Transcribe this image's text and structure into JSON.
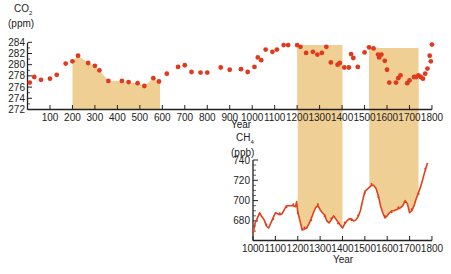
{
  "chart_data": [
    {
      "type": "scatter",
      "title": "",
      "ylabel": "CO2 (ppm)",
      "ylabel_line1": "CO",
      "ylabel_sub": "2",
      "ylabel_line2": "(ppm)",
      "xlabel": "Year",
      "xlim": [
        0,
        1800
      ],
      "ylim": [
        272,
        284
      ],
      "xticks": [
        100,
        200,
        300,
        400,
        500,
        600,
        700,
        800,
        900,
        1000,
        1100,
        1200,
        1300,
        1400,
        1500,
        1600,
        1700,
        1800
      ],
      "yticks": [
        272,
        274,
        276,
        278,
        280,
        282,
        284
      ],
      "shaded_intervals": [
        [
          200,
          590
        ],
        [
          1200,
          1400
        ],
        [
          1520,
          1740
        ]
      ],
      "points": [
        [
          10,
          276.8
        ],
        [
          30,
          277.8
        ],
        [
          60,
          277.3
        ],
        [
          100,
          277.5
        ],
        [
          130,
          278.2
        ],
        [
          170,
          280.2
        ],
        [
          200,
          280.6
        ],
        [
          225,
          281.6
        ],
        [
          270,
          280.3
        ],
        [
          300,
          279.8
        ],
        [
          320,
          279
        ],
        [
          360,
          277.1
        ],
        [
          420,
          277.1
        ],
        [
          450,
          276.9
        ],
        [
          490,
          276.7
        ],
        [
          520,
          276.2
        ],
        [
          560,
          277.6
        ],
        [
          585,
          277
        ],
        [
          620,
          278.4
        ],
        [
          670,
          279.6
        ],
        [
          700,
          279.9
        ],
        [
          730,
          278.7
        ],
        [
          770,
          278.6
        ],
        [
          800,
          278.6
        ],
        [
          860,
          279.5
        ],
        [
          900,
          279.1
        ],
        [
          950,
          279.2
        ],
        [
          980,
          278.7
        ],
        [
          1010,
          279.6
        ],
        [
          1025,
          281.3
        ],
        [
          1040,
          280.8
        ],
        [
          1060,
          282.7
        ],
        [
          1090,
          282.3
        ],
        [
          1110,
          282.7
        ],
        [
          1140,
          283.5
        ],
        [
          1160,
          283.5
        ],
        [
          1200,
          283.5
        ],
        [
          1215,
          283.2
        ],
        [
          1240,
          282.1
        ],
        [
          1270,
          282.3
        ],
        [
          1290,
          281.8
        ],
        [
          1310,
          282.1
        ],
        [
          1330,
          283.2
        ],
        [
          1350,
          280.4
        ],
        [
          1380,
          280
        ],
        [
          1390,
          280.3
        ],
        [
          1410,
          279.5
        ],
        [
          1430,
          279.5
        ],
        [
          1440,
          281.9
        ],
        [
          1450,
          281.2
        ],
        [
          1470,
          279.6
        ],
        [
          1500,
          282.2
        ],
        [
          1520,
          283.1
        ],
        [
          1540,
          282.9
        ],
        [
          1560,
          281.8
        ],
        [
          1565,
          281.3
        ],
        [
          1575,
          281.8
        ],
        [
          1590,
          280.7
        ],
        [
          1600,
          279.1
        ],
        [
          1610,
          276.8
        ],
        [
          1640,
          276.8
        ],
        [
          1650,
          277.6
        ],
        [
          1660,
          278.1
        ],
        [
          1690,
          276.7
        ],
        [
          1700,
          277.2
        ],
        [
          1720,
          277.8
        ],
        [
          1730,
          277.8
        ],
        [
          1740,
          278.1
        ],
        [
          1750,
          277.8
        ],
        [
          1760,
          277.5
        ],
        [
          1770,
          278.4
        ],
        [
          1780,
          279.3
        ],
        [
          1795,
          280.6
        ],
        [
          1800,
          283.6
        ],
        [
          1790,
          281.6
        ]
      ]
    },
    {
      "type": "line",
      "title": "",
      "ylabel": "CH4 (ppb)",
      "ylabel_line1": "CH",
      "ylabel_sub": "4",
      "ylabel_line2": "(ppb)",
      "xlabel": "Year",
      "xlim": [
        1000,
        1800
      ],
      "ylim": [
        665,
        740
      ],
      "xticks": [
        1000,
        1100,
        1200,
        1300,
        1400,
        1500,
        1600,
        1700,
        1800
      ],
      "yticks": [
        680,
        700,
        720,
        740
      ],
      "shaded_intervals": [
        [
          1200,
          1400
        ],
        [
          1520,
          1740
        ]
      ],
      "series": [
        {
          "name": "CH4",
          "x": [
            1000,
            1010,
            1020,
            1030,
            1040,
            1050,
            1060,
            1070,
            1080,
            1090,
            1100,
            1110,
            1120,
            1130,
            1140,
            1150,
            1160,
            1170,
            1180,
            1190,
            1195,
            1200,
            1210,
            1220,
            1230,
            1240,
            1250,
            1260,
            1270,
            1280,
            1290,
            1300,
            1310,
            1320,
            1330,
            1340,
            1350,
            1360,
            1370,
            1380,
            1390,
            1400,
            1410,
            1420,
            1430,
            1440,
            1450,
            1460,
            1470,
            1480,
            1490,
            1500,
            1510,
            1520,
            1530,
            1540,
            1550,
            1560,
            1570,
            1580,
            1590,
            1600,
            1610,
            1620,
            1630,
            1640,
            1650,
            1660,
            1670,
            1680,
            1690,
            1700,
            1710,
            1720,
            1730,
            1740,
            1750,
            1760,
            1770,
            1780
          ],
          "values": [
            667,
            678,
            683,
            688,
            684,
            681,
            675,
            673,
            678,
            683,
            688,
            687,
            686,
            687,
            691,
            695,
            695,
            695,
            695,
            694,
            699,
            689,
            680,
            671,
            672,
            673,
            677,
            682,
            688,
            693,
            695,
            691,
            688,
            686,
            680,
            678,
            681,
            685,
            682,
            679,
            676,
            673,
            677,
            680,
            682,
            682,
            680,
            681,
            684,
            690,
            700,
            709,
            711,
            713,
            715,
            715,
            712,
            705,
            695,
            688,
            683,
            685,
            688,
            690,
            690,
            691,
            692,
            693,
            695,
            700,
            697,
            688,
            690,
            695,
            702,
            708,
            714,
            722,
            730,
            737
          ]
        }
      ]
    }
  ],
  "labels": {
    "top_xlabel": "Year",
    "bottom_xlabel": "Year"
  },
  "colors": {
    "point": "#e03a1e",
    "line": "#e0401c",
    "shade": "#f0cf95",
    "axis": "#222222"
  }
}
